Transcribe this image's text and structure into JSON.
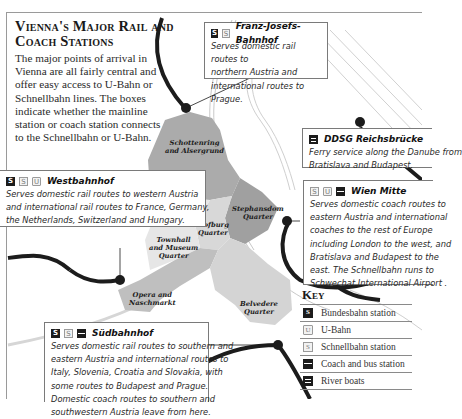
{
  "title": "Vienna's Major Rail and Coach Stations",
  "intro": "The major points of arrival in Vienna are all fairly central and offer easy access to U-Bahn or Schnellbahn lines. The boxes indicate whether the mainline station or coach station connects to the Schnellbahn or U-Bahn.",
  "stations": {
    "franz_josefs": {
      "name": "Franz-Josefs-Bahnhof",
      "icons": [
        "bundesbahn-icon",
        "schnellbahn-icon"
      ],
      "lines": [
        "Serves domestic rail routes to",
        "northern Austria and",
        "international routes to Prague."
      ]
    },
    "ddsg": {
      "name": "DDSG Reichsbrücke",
      "icons": [
        "river-boat-icon"
      ],
      "lines": [
        "Ferry service along the Danube from",
        "Bratislava and Budapest."
      ]
    },
    "westbahnhof": {
      "name": "Westbahnhof",
      "icons": [
        "bundesbahn-icon",
        "schnellbahn-icon",
        "u-bahn-icon"
      ],
      "lines": [
        "Serves domestic rail routes to western Austria",
        "and international rail routes to France, Germany,",
        "the Netherlands, Switzerland and Hungary."
      ]
    },
    "wien_mitte": {
      "name": "Wien Mitte",
      "icons": [
        "schnellbahn-icon",
        "u-bahn-icon",
        "coach-icon"
      ],
      "lines": [
        "Serves domestic coach routes to",
        "eastern Austria and international",
        "coaches to the rest of Europe",
        "including London to the west, and",
        "Bratislava and Budapest to the",
        "east. The Schnellbahn runs to",
        "Schwechat International Airport ."
      ]
    },
    "suedbahnhof": {
      "name": "Südbahnhof",
      "icons": [
        "bundesbahn-icon",
        "schnellbahn-icon",
        "coach-icon"
      ],
      "lines": [
        "Serves domestic rail routes to southern and",
        "eastern Austria and international routes to",
        "Italy, Slovenia, Croatia and Slovakia, with",
        "some routes to Budapest and Prague.",
        "Domestic coach routes to southern and",
        "southwestern Austria leave from here."
      ]
    }
  },
  "quarters": {
    "schottenring": [
      "Schottenring",
      "and Alsergrund"
    ],
    "stephansdom": [
      "Stephansdom",
      "Quarter"
    ],
    "hofburg": [
      "Hofburg",
      "Quarter"
    ],
    "townhall": [
      "Townhall",
      "and Museum",
      "Quarter"
    ],
    "opera": [
      "Opera and",
      "Naschmarkt"
    ],
    "belvedere": [
      "Belvedere",
      "Quarter"
    ]
  },
  "key": {
    "title": "Key",
    "items": [
      {
        "icon": "bundesbahn-icon",
        "label": "Bundesbahn station"
      },
      {
        "icon": "u-bahn-icon",
        "label": "U-Bahn"
      },
      {
        "icon": "schnellbahn-icon",
        "label": "Schnellbahn station"
      },
      {
        "icon": "coach-icon",
        "label": "Coach and bus station"
      },
      {
        "icon": "river-boat-icon",
        "label": "River boats"
      }
    ]
  },
  "icon_glyphs": {
    "bundesbahn": "S",
    "schnellbahn": "S",
    "ubahn": "U"
  },
  "colors": {
    "district_dark": "#a8a8a8",
    "district_mid": "#c4c4c4",
    "district_light": "#dcdcdc",
    "rail_line": "#1c1c1c",
    "border": "#7a7a7a"
  }
}
